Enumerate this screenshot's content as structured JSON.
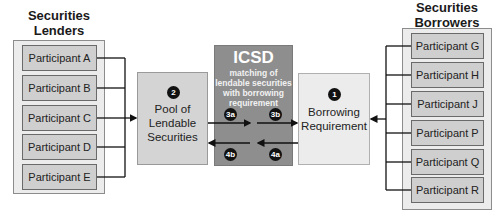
{
  "lenders": {
    "heading": [
      "Securities",
      "Lenders"
    ],
    "participants": [
      "Participant A",
      "Participant B",
      "Participant C",
      "Participant D",
      "Participant E"
    ]
  },
  "borrowers": {
    "heading": [
      "Securities",
      "Borrowers"
    ],
    "participants": [
      "Participant G",
      "Participant H",
      "Participant J",
      "Participant P",
      "Participant Q",
      "Participant R"
    ]
  },
  "pool": {
    "step": "2",
    "label": [
      "Pool of",
      "Lendable",
      "Securities"
    ]
  },
  "icsd": {
    "title": "ICSD",
    "subtitle": [
      "matching of",
      "lendable securities",
      "with borrowing",
      "requirement"
    ],
    "steps": {
      "s3a": "3a",
      "s3b": "3b",
      "s4a": "4a",
      "s4b": "4b"
    }
  },
  "borrowing": {
    "step": "1",
    "label": [
      "Borrowing",
      "Requirement"
    ]
  },
  "colors": {
    "icsd_fill": "#8e8e8e",
    "participant_fill": "#cfcfcf",
    "group_fill": "#ececec",
    "badge": "#111111"
  }
}
